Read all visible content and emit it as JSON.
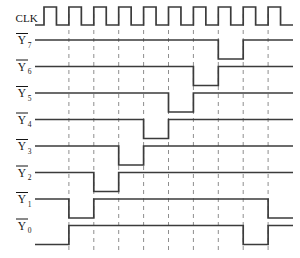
{
  "diagram": {
    "kind": "timing-diagram",
    "colors": {
      "waveform": "#3b3b3b",
      "gridline": "#8e8e8e",
      "text": "#151515",
      "background": "#ffffff"
    }
  },
  "clock": {
    "label": "CLK",
    "pulse_count": 9,
    "high_level_label": "1",
    "low_level_label": "0"
  },
  "signals": [
    {
      "name": "Y7",
      "label": "Y",
      "subscript": "7",
      "overbar": true,
      "active_low_state": 7
    },
    {
      "name": "Y6",
      "label": "Y",
      "subscript": "6",
      "overbar": true,
      "active_low_state": 6
    },
    {
      "name": "Y5",
      "label": "Y",
      "subscript": "5",
      "overbar": true,
      "active_low_state": 5
    },
    {
      "name": "Y4",
      "label": "Y",
      "subscript": "4",
      "overbar": true,
      "active_low_state": 4
    },
    {
      "name": "Y3",
      "label": "Y",
      "subscript": "3",
      "overbar": true,
      "active_low_state": 3
    },
    {
      "name": "Y2",
      "label": "Y",
      "subscript": "2",
      "overbar": true,
      "active_low_state": 2
    },
    {
      "name": "Y1",
      "label": "Y",
      "subscript": "1",
      "overbar": true,
      "active_low_state": 1
    },
    {
      "name": "Y0",
      "label": "Y",
      "subscript": "0",
      "overbar": true,
      "active_low_state": 0
    }
  ],
  "chart_data": {
    "type": "line",
    "xlabel": "",
    "ylabel": "",
    "x": [
      0,
      1,
      2,
      3,
      4,
      5,
      6,
      7,
      8,
      9
    ],
    "x_unit": "clock state",
    "grid": true,
    "legend_position": "left",
    "series": [
      {
        "name": "CLK",
        "values": [
          1,
          1,
          1,
          1,
          1,
          1,
          1,
          1,
          1,
          1
        ],
        "note": "square wave, one pulse per state"
      },
      {
        "name": "Y7",
        "values": [
          1,
          1,
          1,
          1,
          1,
          1,
          1,
          0,
          1,
          1
        ]
      },
      {
        "name": "Y6",
        "values": [
          1,
          1,
          1,
          1,
          1,
          1,
          0,
          1,
          1,
          1
        ]
      },
      {
        "name": "Y5",
        "values": [
          1,
          1,
          1,
          1,
          1,
          0,
          1,
          1,
          1,
          1
        ]
      },
      {
        "name": "Y4",
        "values": [
          1,
          1,
          1,
          1,
          0,
          1,
          1,
          1,
          1,
          1
        ]
      },
      {
        "name": "Y3",
        "values": [
          1,
          1,
          1,
          0,
          1,
          1,
          1,
          1,
          1,
          1
        ]
      },
      {
        "name": "Y2",
        "values": [
          1,
          1,
          0,
          1,
          1,
          1,
          1,
          1,
          1,
          1
        ]
      },
      {
        "name": "Y1",
        "values": [
          1,
          0,
          1,
          1,
          1,
          1,
          1,
          1,
          1,
          0
        ]
      },
      {
        "name": "Y0",
        "values": [
          0,
          1,
          1,
          1,
          1,
          1,
          1,
          1,
          0,
          1
        ]
      }
    ]
  }
}
